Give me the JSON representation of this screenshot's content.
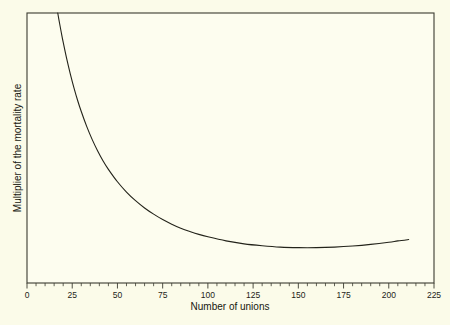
{
  "figure": {
    "background_color": "#fbfbe9",
    "plot_background_color": "#fdfdef",
    "frame_color": "#3b3b30",
    "curve_color": "#23231a"
  },
  "chart_data": {
    "type": "line",
    "title": "",
    "subtitle": "",
    "xlabel": "Number of unions",
    "ylabel": "Multiplier of the mortality rate",
    "xlim": [
      0,
      225
    ],
    "ylim": [
      0,
      1
    ],
    "grid": false,
    "legend": null,
    "x_major_ticks": [
      0,
      25,
      50,
      75,
      100,
      125,
      150,
      175,
      200,
      225
    ],
    "x_tick_labels": [
      "0",
      "25",
      "50",
      "75",
      "100",
      "125",
      "150",
      "175",
      "200",
      "225"
    ],
    "x_minor_tick_interval": 5,
    "y_major_ticks": [],
    "y_tick_labels": [],
    "y_axis_numeric_labels_shown": false,
    "annotations": [],
    "series": [
      {
        "name": "Multiplier of the mortality rate",
        "x": [
          17,
          18,
          19,
          20,
          22,
          24,
          26,
          28,
          30,
          33,
          36,
          39,
          42,
          45,
          50,
          55,
          60,
          65,
          70,
          75,
          80,
          85,
          90,
          95,
          100,
          110,
          120,
          130,
          140,
          150,
          160,
          170,
          180,
          190,
          200,
          205,
          211
        ],
        "y": [
          1.0,
          0.962,
          0.926,
          0.892,
          0.829,
          0.773,
          0.722,
          0.676,
          0.635,
          0.58,
          0.532,
          0.49,
          0.453,
          0.421,
          0.375,
          0.337,
          0.305,
          0.278,
          0.255,
          0.235,
          0.218,
          0.203,
          0.191,
          0.18,
          0.171,
          0.156,
          0.145,
          0.138,
          0.133,
          0.131,
          0.131,
          0.133,
          0.137,
          0.143,
          0.151,
          0.156,
          0.161
        ]
      }
    ]
  },
  "axis_titles": {
    "x": "Number of unions",
    "y": "Multiplier of the mortality rate"
  }
}
